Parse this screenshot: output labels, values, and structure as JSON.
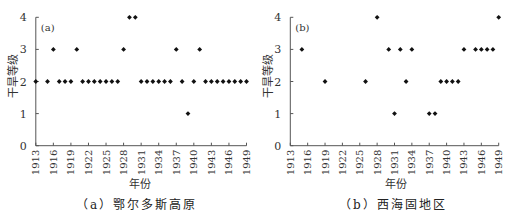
{
  "chart_data": [
    {
      "type": "scatter",
      "title": "(a) 鄂尔多斯高原",
      "panel_tag": "(a)",
      "xlabel": "年份",
      "ylabel": "干旱等级",
      "xlim": [
        1913,
        1949
      ],
      "ylim": [
        0,
        4
      ],
      "xticks": [
        "1913",
        "1916",
        "1919",
        "1922",
        "1925",
        "1928",
        "1931",
        "1934",
        "1937",
        "1940",
        "1943",
        "1946",
        "1949"
      ],
      "yticks": [
        "0",
        "1",
        "2",
        "3",
        "4"
      ],
      "grid": false,
      "legend": null,
      "points": [
        {
          "x": 1913,
          "y": 2
        },
        {
          "x": 1915,
          "y": 2
        },
        {
          "x": 1916,
          "y": 3
        },
        {
          "x": 1917,
          "y": 2
        },
        {
          "x": 1918,
          "y": 2
        },
        {
          "x": 1919,
          "y": 2
        },
        {
          "x": 1920,
          "y": 3
        },
        {
          "x": 1921,
          "y": 2
        },
        {
          "x": 1922,
          "y": 2
        },
        {
          "x": 1923,
          "y": 2
        },
        {
          "x": 1924,
          "y": 2
        },
        {
          "x": 1925,
          "y": 2
        },
        {
          "x": 1926,
          "y": 2
        },
        {
          "x": 1927,
          "y": 2
        },
        {
          "x": 1928,
          "y": 3
        },
        {
          "x": 1929,
          "y": 4
        },
        {
          "x": 1930,
          "y": 4
        },
        {
          "x": 1931,
          "y": 2
        },
        {
          "x": 1932,
          "y": 2
        },
        {
          "x": 1933,
          "y": 2
        },
        {
          "x": 1934,
          "y": 2
        },
        {
          "x": 1935,
          "y": 2
        },
        {
          "x": 1936,
          "y": 2
        },
        {
          "x": 1937,
          "y": 3
        },
        {
          "x": 1938,
          "y": 2
        },
        {
          "x": 1939,
          "y": 1
        },
        {
          "x": 1940,
          "y": 2
        },
        {
          "x": 1941,
          "y": 3
        },
        {
          "x": 1942,
          "y": 2
        },
        {
          "x": 1943,
          "y": 2
        },
        {
          "x": 1944,
          "y": 2
        },
        {
          "x": 1945,
          "y": 2
        },
        {
          "x": 1946,
          "y": 2
        },
        {
          "x": 1947,
          "y": 2
        },
        {
          "x": 1948,
          "y": 2
        },
        {
          "x": 1949,
          "y": 2
        }
      ]
    },
    {
      "type": "scatter",
      "title": "(b) 西海固地区",
      "panel_tag": "(b)",
      "xlabel": "年份",
      "ylabel": "干旱等级",
      "xlim": [
        1913,
        1949
      ],
      "ylim": [
        0,
        4
      ],
      "xticks": [
        "1913",
        "1916",
        "1919",
        "1922",
        "1925",
        "1928",
        "1931",
        "1934",
        "1937",
        "1940",
        "1943",
        "1946",
        "1949"
      ],
      "yticks": [
        "0",
        "1",
        "2",
        "3",
        "4"
      ],
      "grid": false,
      "legend": null,
      "points": [
        {
          "x": 1915,
          "y": 3
        },
        {
          "x": 1919,
          "y": 2
        },
        {
          "x": 1926,
          "y": 2
        },
        {
          "x": 1928,
          "y": 4
        },
        {
          "x": 1930,
          "y": 3
        },
        {
          "x": 1931,
          "y": 1
        },
        {
          "x": 1932,
          "y": 3
        },
        {
          "x": 1933,
          "y": 2
        },
        {
          "x": 1934,
          "y": 3
        },
        {
          "x": 1937,
          "y": 1
        },
        {
          "x": 1938,
          "y": 1
        },
        {
          "x": 1939,
          "y": 2
        },
        {
          "x": 1940,
          "y": 2
        },
        {
          "x": 1941,
          "y": 2
        },
        {
          "x": 1942,
          "y": 2
        },
        {
          "x": 1943,
          "y": 3
        },
        {
          "x": 1945,
          "y": 3
        },
        {
          "x": 1946,
          "y": 3
        },
        {
          "x": 1947,
          "y": 3
        },
        {
          "x": 1948,
          "y": 3
        },
        {
          "x": 1949,
          "y": 4
        }
      ]
    }
  ],
  "colors": {
    "axis": "#555555",
    "marker": "#111111",
    "text": "#333333"
  },
  "panels": [
    {
      "caption": "（a）鄂尔多斯高原",
      "xlabel": "年份",
      "ylabel": "干旱等级"
    },
    {
      "caption": "（b）西海固地区",
      "xlabel": "年份",
      "ylabel": "干旱等级"
    }
  ]
}
